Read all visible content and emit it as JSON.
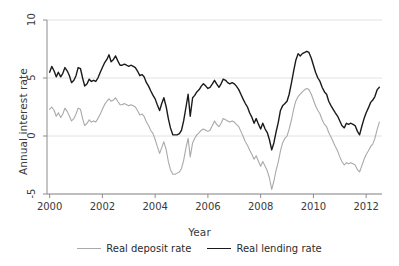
{
  "chart_data": {
    "type": "line",
    "title": "",
    "xlabel": "Year",
    "ylabel": "Annual interest rate",
    "xlim": [
      1999.9,
      2012.6
    ],
    "ylim": [
      -5,
      10
    ],
    "grid": true,
    "gridlines_y": [
      10,
      5,
      0,
      -5
    ],
    "xticks": [
      2000,
      2002,
      2004,
      2006,
      2008,
      2010,
      2012
    ],
    "xtick_labels": [
      "2000",
      "2002",
      "2004",
      "2006",
      "2008",
      "2010",
      "2012"
    ],
    "yticks": [
      10,
      5,
      0,
      -5
    ],
    "ytick_labels": [
      "10",
      "5",
      "0",
      "-5"
    ],
    "legend_position": "bottom-center",
    "series": [
      {
        "name": "Real deposit rate",
        "color": "#a9a9a9",
        "linewidth": 1.1,
        "x": [
          2000.0,
          2000.08,
          2000.17,
          2000.25,
          2000.33,
          2000.42,
          2000.5,
          2000.58,
          2000.67,
          2000.75,
          2000.83,
          2000.92,
          2001.0,
          2001.08,
          2001.17,
          2001.25,
          2001.33,
          2001.42,
          2001.5,
          2001.58,
          2001.67,
          2001.75,
          2001.83,
          2001.92,
          2002.0,
          2002.08,
          2002.17,
          2002.25,
          2002.33,
          2002.42,
          2002.5,
          2002.58,
          2002.67,
          2002.75,
          2002.83,
          2002.92,
          2003.0,
          2003.08,
          2003.17,
          2003.25,
          2003.33,
          2003.42,
          2003.5,
          2003.58,
          2003.67,
          2003.75,
          2003.83,
          2003.92,
          2004.0,
          2004.08,
          2004.17,
          2004.25,
          2004.33,
          2004.42,
          2004.5,
          2004.58,
          2004.67,
          2004.75,
          2004.83,
          2004.92,
          2005.0,
          2005.08,
          2005.17,
          2005.25,
          2005.33,
          2005.42,
          2005.5,
          2005.58,
          2005.67,
          2005.75,
          2005.83,
          2005.92,
          2006.0,
          2006.08,
          2006.17,
          2006.25,
          2006.33,
          2006.42,
          2006.5,
          2006.58,
          2006.67,
          2006.75,
          2006.83,
          2006.92,
          2007.0,
          2007.08,
          2007.17,
          2007.25,
          2007.33,
          2007.42,
          2007.5,
          2007.58,
          2007.67,
          2007.75,
          2007.83,
          2007.92,
          2008.0,
          2008.08,
          2008.17,
          2008.25,
          2008.33,
          2008.42,
          2008.5,
          2008.58,
          2008.67,
          2008.75,
          2008.83,
          2008.92,
          2009.0,
          2009.08,
          2009.17,
          2009.25,
          2009.33,
          2009.42,
          2009.5,
          2009.58,
          2009.67,
          2009.75,
          2009.83,
          2009.92,
          2010.0,
          2010.08,
          2010.17,
          2010.25,
          2010.33,
          2010.42,
          2010.5,
          2010.58,
          2010.67,
          2010.75,
          2010.83,
          2010.92,
          2011.0,
          2011.08,
          2011.17,
          2011.25,
          2011.33,
          2011.42,
          2011.5,
          2011.58,
          2011.67,
          2011.75,
          2011.83,
          2011.92,
          2012.0,
          2012.08,
          2012.17,
          2012.25,
          2012.33,
          2012.42,
          2012.5
        ],
        "values": [
          2.3,
          2.5,
          2.2,
          1.7,
          2.0,
          1.6,
          1.9,
          2.4,
          2.1,
          1.7,
          1.3,
          1.5,
          1.9,
          2.4,
          2.3,
          1.5,
          0.9,
          1.1,
          1.4,
          1.2,
          1.3,
          1.2,
          1.5,
          1.9,
          2.3,
          2.7,
          3.0,
          3.2,
          3.0,
          3.1,
          3.3,
          3.0,
          2.7,
          2.7,
          2.8,
          2.7,
          2.6,
          2.7,
          2.6,
          2.5,
          2.2,
          1.8,
          1.9,
          1.7,
          1.2,
          0.9,
          0.5,
          0.2,
          -0.3,
          -0.9,
          -1.5,
          -1.0,
          -0.5,
          -1.2,
          -2.2,
          -2.9,
          -3.3,
          -3.3,
          -3.2,
          -3.1,
          -2.8,
          -2.1,
          -1.0,
          -0.2,
          -1.8,
          -0.6,
          -0.2,
          0.1,
          0.3,
          0.5,
          0.6,
          0.5,
          0.4,
          0.5,
          0.9,
          1.3,
          1.0,
          0.8,
          1.1,
          1.5,
          1.4,
          1.3,
          1.2,
          1.3,
          1.2,
          1.0,
          0.8,
          0.4,
          0.0,
          -0.5,
          -0.8,
          -1.2,
          -1.6,
          -2.0,
          -1.7,
          -2.2,
          -2.6,
          -2.2,
          -2.6,
          -3.0,
          -3.6,
          -4.6,
          -3.9,
          -3.0,
          -2.2,
          -1.3,
          -0.6,
          -0.2,
          0.0,
          0.6,
          1.4,
          2.3,
          3.0,
          3.4,
          3.6,
          3.8,
          4.0,
          4.1,
          4.0,
          3.6,
          3.1,
          2.6,
          2.2,
          1.9,
          1.4,
          1.0,
          0.8,
          0.3,
          -0.1,
          -0.5,
          -0.9,
          -1.3,
          -1.8,
          -2.2,
          -2.5,
          -2.3,
          -2.4,
          -2.3,
          -2.4,
          -2.5,
          -2.9,
          -3.1,
          -2.6,
          -2.0,
          -1.6,
          -1.3,
          -0.9,
          -0.7,
          -0.2,
          0.6,
          1.2
        ]
      },
      {
        "name": "Real lending rate",
        "color": "#1a1a1a",
        "linewidth": 1.4,
        "x": [
          2000.0,
          2000.08,
          2000.17,
          2000.25,
          2000.33,
          2000.42,
          2000.5,
          2000.58,
          2000.67,
          2000.75,
          2000.83,
          2000.92,
          2001.0,
          2001.08,
          2001.17,
          2001.25,
          2001.33,
          2001.42,
          2001.5,
          2001.58,
          2001.67,
          2001.75,
          2001.83,
          2001.92,
          2002.0,
          2002.08,
          2002.17,
          2002.25,
          2002.33,
          2002.42,
          2002.5,
          2002.58,
          2002.67,
          2002.75,
          2002.83,
          2002.92,
          2003.0,
          2003.08,
          2003.17,
          2003.25,
          2003.33,
          2003.42,
          2003.5,
          2003.58,
          2003.67,
          2003.75,
          2003.83,
          2003.92,
          2004.0,
          2004.08,
          2004.17,
          2004.25,
          2004.33,
          2004.42,
          2004.5,
          2004.58,
          2004.67,
          2004.75,
          2004.83,
          2004.92,
          2005.0,
          2005.08,
          2005.17,
          2005.25,
          2005.33,
          2005.42,
          2005.5,
          2005.58,
          2005.67,
          2005.75,
          2005.83,
          2005.92,
          2006.0,
          2006.08,
          2006.17,
          2006.25,
          2006.33,
          2006.42,
          2006.5,
          2006.58,
          2006.67,
          2006.75,
          2006.83,
          2006.92,
          2007.0,
          2007.08,
          2007.17,
          2007.25,
          2007.33,
          2007.42,
          2007.5,
          2007.58,
          2007.67,
          2007.75,
          2007.83,
          2007.92,
          2008.0,
          2008.08,
          2008.17,
          2008.25,
          2008.33,
          2008.42,
          2008.5,
          2008.58,
          2008.67,
          2008.75,
          2008.83,
          2008.92,
          2009.0,
          2009.08,
          2009.17,
          2009.25,
          2009.33,
          2009.42,
          2009.5,
          2009.58,
          2009.67,
          2009.75,
          2009.83,
          2009.92,
          2010.0,
          2010.08,
          2010.17,
          2010.25,
          2010.33,
          2010.42,
          2010.5,
          2010.58,
          2010.67,
          2010.75,
          2010.83,
          2010.92,
          2011.0,
          2011.08,
          2011.17,
          2011.25,
          2011.33,
          2011.42,
          2011.5,
          2011.58,
          2011.67,
          2011.75,
          2011.83,
          2011.92,
          2012.0,
          2012.08,
          2012.17,
          2012.25,
          2012.33,
          2012.42,
          2012.5
        ],
        "values": [
          5.5,
          6.0,
          5.6,
          5.1,
          5.5,
          5.1,
          5.4,
          5.9,
          5.6,
          5.2,
          4.6,
          4.8,
          5.2,
          5.9,
          5.8,
          5.0,
          4.3,
          4.5,
          4.9,
          4.7,
          4.8,
          4.7,
          5.0,
          5.5,
          5.9,
          6.3,
          6.6,
          7.0,
          6.4,
          6.6,
          6.9,
          6.5,
          6.1,
          6.1,
          6.2,
          6.1,
          6.0,
          6.1,
          6.0,
          5.9,
          5.6,
          5.2,
          5.3,
          5.1,
          4.6,
          4.3,
          3.9,
          3.5,
          3.2,
          2.7,
          2.2,
          2.8,
          3.3,
          2.5,
          1.5,
          0.7,
          0.1,
          0.1,
          0.1,
          0.2,
          0.5,
          1.3,
          2.5,
          3.6,
          1.7,
          3.3,
          3.5,
          3.8,
          4.0,
          4.3,
          4.5,
          4.3,
          4.1,
          4.2,
          4.5,
          4.8,
          4.5,
          4.2,
          4.5,
          4.9,
          4.8,
          4.6,
          4.5,
          4.6,
          4.5,
          4.3,
          4.0,
          3.6,
          3.2,
          2.8,
          2.5,
          2.0,
          1.6,
          1.1,
          1.5,
          1.0,
          0.6,
          1.1,
          0.6,
          0.3,
          -0.3,
          -1.2,
          -0.6,
          0.3,
          1.2,
          2.2,
          2.6,
          2.8,
          3.0,
          3.6,
          4.6,
          5.6,
          6.5,
          7.1,
          6.9,
          7.1,
          7.2,
          7.3,
          7.2,
          6.7,
          6.1,
          5.5,
          5.0,
          4.7,
          4.2,
          3.8,
          3.6,
          3.0,
          2.6,
          2.3,
          2.0,
          1.7,
          1.3,
          0.9,
          0.7,
          1.1,
          1.0,
          1.1,
          1.0,
          0.9,
          0.4,
          0.1,
          0.8,
          1.5,
          2.0,
          2.4,
          2.9,
          3.1,
          3.4,
          4.0,
          4.2
        ]
      }
    ]
  },
  "axis_titles": {
    "y": "Annual interest rate",
    "x": "Year"
  },
  "legend": {
    "items": [
      {
        "label": "Real deposit rate",
        "color": "#a9a9a9"
      },
      {
        "label": "Real lending rate",
        "color": "#1a1a1a"
      }
    ]
  },
  "style": {
    "grid_color": "#e2e2e2",
    "axis_color": "#8c8c8c",
    "text_color": "#3a3a3a",
    "background": "#ffffff"
  }
}
